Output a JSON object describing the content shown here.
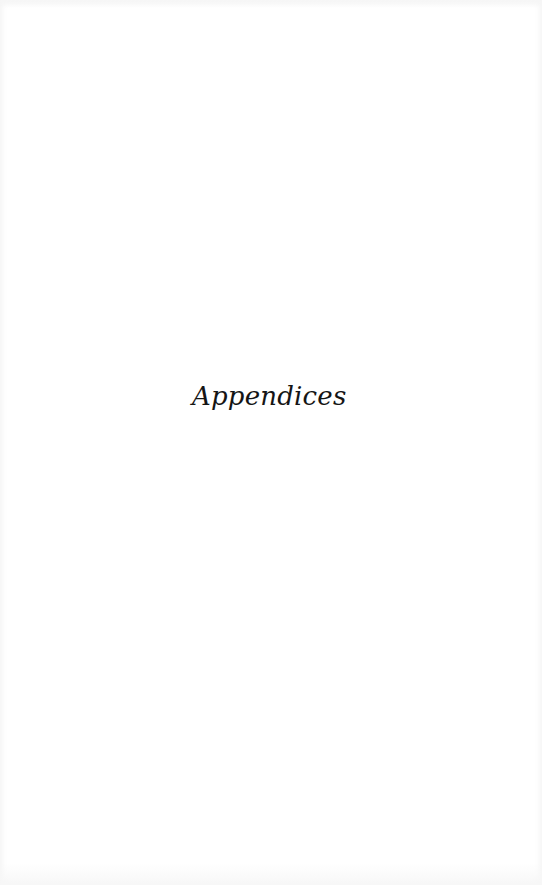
{
  "page": {
    "heading": "Appendices"
  }
}
